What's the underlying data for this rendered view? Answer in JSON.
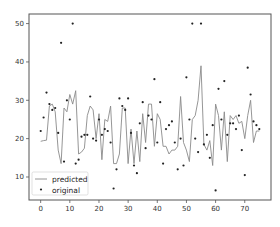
{
  "chart_data": {
    "type": "line",
    "title": "",
    "xlabel": "",
    "ylabel": "",
    "xlim": [
      -4,
      79
    ],
    "ylim": [
      4,
      52.5
    ],
    "x_ticks": [
      0,
      10,
      20,
      30,
      40,
      50,
      60,
      70
    ],
    "y_ticks": [
      10,
      20,
      30,
      40,
      50
    ],
    "grid": false,
    "legend_position": "lower left",
    "legend": [
      "predicted",
      "original"
    ],
    "x": [
      0,
      1,
      2,
      3,
      4,
      5,
      6,
      7,
      8,
      9,
      10,
      11,
      12,
      13,
      14,
      15,
      16,
      17,
      18,
      19,
      20,
      21,
      22,
      23,
      24,
      25,
      26,
      27,
      28,
      29,
      30,
      31,
      32,
      33,
      34,
      35,
      36,
      37,
      38,
      39,
      40,
      41,
      42,
      43,
      44,
      45,
      46,
      47,
      48,
      49,
      50,
      51,
      52,
      53,
      54,
      55,
      56,
      57,
      58,
      59,
      60,
      61,
      62,
      63,
      64,
      65,
      66,
      67,
      68,
      69,
      70,
      71,
      72,
      73,
      74,
      75
    ],
    "series": [
      {
        "name": "predicted",
        "style": "line",
        "color": "#8a8a8a",
        "values": [
          19.3,
          19.5,
          19.6,
          28.5,
          29,
          27,
          17,
          13.5,
          28,
          27,
          31.5,
          29,
          32.5,
          16,
          16.5,
          17.5,
          26,
          28.5,
          27.5,
          20,
          26.5,
          14.5,
          25,
          24.5,
          28.5,
          13.5,
          13.5,
          16,
          28,
          28,
          13.5,
          22.5,
          13.5,
          22,
          14,
          26.5,
          19,
          29,
          29,
          18,
          26.5,
          25,
          18,
          18,
          16,
          17,
          17,
          18,
          31,
          19,
          17,
          14,
          25,
          26,
          30,
          39,
          18.5,
          17,
          19.5,
          13,
          29,
          26,
          17,
          27,
          14,
          26,
          25,
          26,
          24,
          24.5,
          20,
          26,
          30,
          19,
          22,
          22
        ]
      },
      {
        "name": "original",
        "style": "scatter",
        "color": "#222222",
        "values": [
          22,
          25.5,
          32,
          29,
          27.5,
          28,
          21.5,
          45,
          14,
          30,
          25,
          50,
          13.5,
          14.5,
          20.5,
          21,
          21,
          31,
          20,
          19.5,
          25,
          21,
          22.5,
          22,
          19,
          7,
          12,
          30.5,
          28.5,
          27.5,
          30.5,
          21.5,
          13,
          11,
          24,
          29.5,
          17.5,
          26,
          25,
          35.5,
          19,
          29.5,
          13.5,
          22.5,
          23.5,
          24.5,
          19,
          12,
          20,
          13,
          36,
          25,
          50,
          20,
          16.5,
          50,
          18.5,
          21,
          15,
          23.5,
          6.5,
          33,
          25,
          35,
          21,
          24,
          24,
          22.5,
          26,
          17,
          10.5,
          38.5,
          31.5,
          24.5,
          23.5,
          22.5
        ]
      }
    ]
  },
  "frame": {
    "axes_color": "#555555",
    "background": "#ffffff"
  }
}
